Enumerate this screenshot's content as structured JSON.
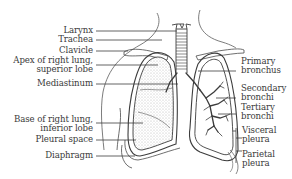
{
  "diagram": {
    "labels_left": [
      {
        "id": "larynx",
        "lines": [
          "Larynx"
        ]
      },
      {
        "id": "trachea",
        "lines": [
          "Trachea"
        ]
      },
      {
        "id": "clavicle",
        "lines": [
          "Clavicle"
        ]
      },
      {
        "id": "apex",
        "lines": [
          "Apex of right lung,",
          "superior lobe"
        ]
      },
      {
        "id": "mediastinum",
        "lines": [
          "Mediastinum"
        ]
      },
      {
        "id": "base",
        "lines": [
          "Base of right lung,",
          "inferior lobe"
        ]
      },
      {
        "id": "pleural_space",
        "lines": [
          "Pleural space"
        ]
      },
      {
        "id": "diaphragm",
        "lines": [
          "Diaphragm"
        ]
      }
    ],
    "labels_right": [
      {
        "id": "primary_bronchus",
        "lines": [
          "Primary",
          "bronchus"
        ]
      },
      {
        "id": "secondary_bronchi",
        "lines": [
          "Secondary",
          "bronchi"
        ]
      },
      {
        "id": "tertiary_bronchi",
        "lines": [
          "Tertiary",
          "bronchi"
        ]
      },
      {
        "id": "visceral_pleura",
        "lines": [
          "Visceral",
          "pleura"
        ]
      },
      {
        "id": "parietal_pleura",
        "lines": [
          "Parietal",
          "pleura"
        ]
      }
    ],
    "colors": {
      "line": "#3c3c3c",
      "text": "#3a3a3a",
      "stipple": "#bdbdbd",
      "background": "#ffffff"
    }
  }
}
